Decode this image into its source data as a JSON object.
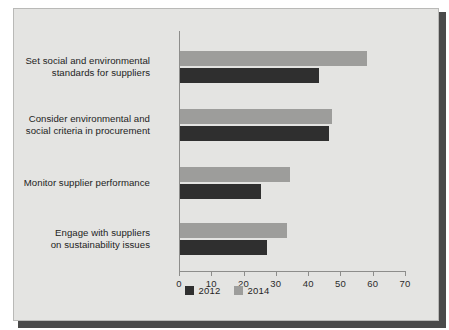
{
  "chart_data": {
    "type": "bar",
    "orientation": "horizontal",
    "title": "",
    "xlabel": "",
    "ylabel": "",
    "xlim": [
      0,
      70
    ],
    "xticks": [
      0,
      10,
      20,
      30,
      40,
      50,
      60,
      70
    ],
    "xtick_labels": [
      "0",
      "10",
      "20",
      "30",
      "40",
      "50",
      "60",
      "70"
    ],
    "grid": false,
    "legend_position": "bottom-center",
    "categories": [
      "Set social and environmental\nstandards for suppliers",
      "Consider environmental and\nsocial criteria in procurement",
      "Monitor supplier performance",
      "Engage with suppliers\non sustainability issues"
    ],
    "series": [
      {
        "name": "2012",
        "color": "#2f2f2f",
        "values": [
          43,
          46,
          25,
          27
        ]
      },
      {
        "name": "2014",
        "color": "#9d9d9b",
        "values": [
          58,
          47,
          34,
          33
        ]
      }
    ]
  },
  "legend": {
    "items": [
      {
        "label": "2012",
        "color": "#2f2f2f"
      },
      {
        "label": "2014",
        "color": "#9d9d9b"
      }
    ]
  },
  "style": {
    "panel_background": "#e4e4e2",
    "panel_border": "#b9b9b7",
    "axis_color": "#8d8d8b",
    "text_color": "#232323",
    "shadow_color": "#4a4a4a"
  }
}
